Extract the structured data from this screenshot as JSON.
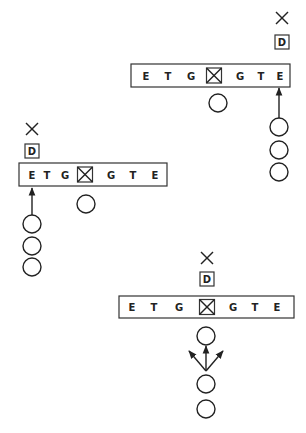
{
  "diagram": {
    "type": "football-formation-plays",
    "colors": {
      "ink": "#222222",
      "background": "#ffffff"
    },
    "plays": [
      {
        "id": "top-right",
        "defender": {
          "marker": "X",
          "label": "D",
          "x": 282,
          "x_y": 18,
          "d_y": 42
        },
        "line": {
          "box": {
            "x": 131,
            "y": 64,
            "w": 159,
            "h": 23
          },
          "positions": [
            {
              "label": "E",
              "x": 146
            },
            {
              "label": "T",
              "x": 168
            },
            {
              "label": "G",
              "x": 191
            },
            {
              "label": "C",
              "x": 214,
              "center": true
            },
            {
              "label": "G",
              "x": 240
            },
            {
              "label": "T",
              "x": 261
            },
            {
              "label": "E",
              "x": 280
            }
          ]
        },
        "backfield": [
          {
            "type": "circle",
            "x": 218,
            "y": 103
          },
          {
            "type": "circle",
            "x": 279,
            "y": 127
          },
          {
            "type": "circle",
            "x": 279,
            "y": 150
          },
          {
            "type": "circle",
            "x": 279,
            "y": 172
          }
        ],
        "arrows": [
          {
            "x1": 279,
            "y1": 118,
            "x2": 279,
            "y2": 88
          }
        ]
      },
      {
        "id": "left",
        "defender": {
          "marker": "X",
          "label": "D",
          "x": 32,
          "x_y": 129,
          "d_y": 151
        },
        "line": {
          "box": {
            "x": 19,
            "y": 163,
            "w": 148,
            "h": 23
          },
          "positions": [
            {
              "label": "E",
              "x": 32
            },
            {
              "label": "T",
              "x": 47
            },
            {
              "label": "G",
              "x": 65
            },
            {
              "label": "C",
              "x": 85,
              "center": true
            },
            {
              "label": "G",
              "x": 111
            },
            {
              "label": "T",
              "x": 133
            },
            {
              "label": "E",
              "x": 155
            }
          ]
        },
        "backfield": [
          {
            "type": "circle",
            "x": 86,
            "y": 204
          },
          {
            "type": "circle",
            "x": 32,
            "y": 224
          },
          {
            "type": "circle",
            "x": 32,
            "y": 246
          },
          {
            "type": "circle",
            "x": 32,
            "y": 267
          }
        ],
        "arrows": [
          {
            "x1": 32,
            "y1": 215,
            "x2": 32,
            "y2": 188
          }
        ]
      },
      {
        "id": "bottom",
        "defender": {
          "marker": "X",
          "label": "D",
          "x": 207,
          "x_y": 258,
          "d_y": 279
        },
        "line": {
          "box": {
            "x": 119,
            "y": 296,
            "w": 175,
            "h": 22
          },
          "positions": [
            {
              "label": "E",
              "x": 132
            },
            {
              "label": "T",
              "x": 154
            },
            {
              "label": "G",
              "x": 179
            },
            {
              "label": "C",
              "x": 207,
              "center": true
            },
            {
              "label": "G",
              "x": 233
            },
            {
              "label": "T",
              "x": 255
            },
            {
              "label": "E",
              "x": 277
            }
          ]
        },
        "backfield": [
          {
            "type": "circle",
            "x": 206,
            "y": 336
          },
          {
            "type": "circle",
            "x": 206,
            "y": 384
          },
          {
            "type": "circle",
            "x": 206,
            "y": 409
          }
        ],
        "arrows": [
          {
            "x1": 206,
            "y1": 371,
            "x2": 206,
            "y2": 346
          },
          {
            "x1": 206,
            "y1": 371,
            "x2": 189,
            "y2": 351
          },
          {
            "x1": 206,
            "y1": 371,
            "x2": 223,
            "y2": 351
          }
        ]
      }
    ]
  }
}
